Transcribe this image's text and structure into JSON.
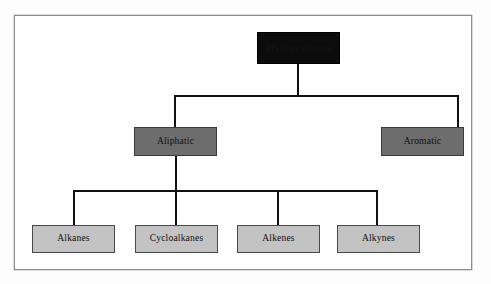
{
  "diagram": {
    "type": "hierarchy-tree",
    "levels": 3,
    "colors": {
      "root_fill": "#0c0c0c",
      "mid_fill": "#6d6d6d",
      "leaf_fill": "#c3c3c3",
      "connector": "#111111",
      "frame_border": "#8d8d8d",
      "page_background": "#fdfdfd"
    },
    "root": {
      "label": "Hydrocarbons",
      "legible": false,
      "note": "dark text on black fill, not readable in source image"
    },
    "level2": [
      {
        "label": "Aliphatic"
      },
      {
        "label": "Aromatic"
      }
    ],
    "level3": [
      {
        "label": "Alkanes"
      },
      {
        "label": "Cycloalkanes"
      },
      {
        "label": "Alkenes"
      },
      {
        "label": "Alkynes"
      }
    ],
    "edges": [
      {
        "from": "Hydrocarbons",
        "to": "Aliphatic"
      },
      {
        "from": "Hydrocarbons",
        "to": "Aromatic"
      },
      {
        "from": "Aliphatic",
        "to": "Alkanes"
      },
      {
        "from": "Aliphatic",
        "to": "Cycloalkanes"
      },
      {
        "from": "Aliphatic",
        "to": "Alkenes"
      },
      {
        "from": "Aliphatic",
        "to": "Alkynes"
      }
    ]
  }
}
